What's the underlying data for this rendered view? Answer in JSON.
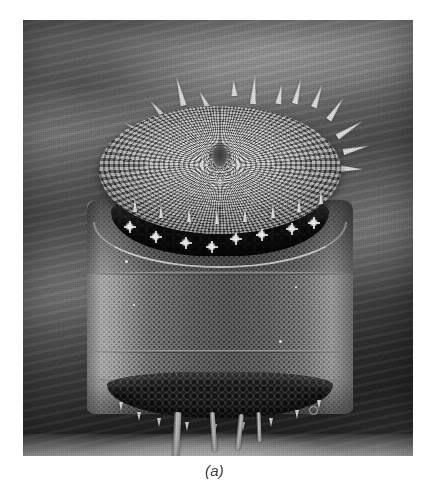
{
  "figure": {
    "caption": "(a)",
    "kind": "scanning-electron-micrograph",
    "palette": {
      "page_background": "#ffffff",
      "caption_color": "#3a3a3a",
      "photo_dark": "#242424",
      "photo_mid": "#6f6f6f",
      "photo_light": "#dcdcdc",
      "highlight": "#f2f2f2"
    },
    "photo": {
      "x": 23,
      "y": 20,
      "width": 390,
      "height": 436,
      "colorspace": "grayscale"
    },
    "features": {
      "valve_face_label": "top valve face with radial areolae",
      "front_pore_band_label": "coarse areolae band",
      "girdle_label": "girdle bands",
      "basal_band_label": "basal areolae band",
      "spines_label": "marginal spines",
      "legs_label": "basal setae"
    },
    "spines": [
      {
        "x": 96,
        "y": 4,
        "len": 30,
        "rot": -14
      },
      {
        "x": 120,
        "y": 18,
        "len": 20,
        "rot": -26
      },
      {
        "x": 74,
        "y": 26,
        "len": 24,
        "rot": -40
      },
      {
        "x": 52,
        "y": 44,
        "len": 26,
        "rot": -62
      },
      {
        "x": 34,
        "y": 62,
        "len": 22,
        "rot": -78
      },
      {
        "x": 28,
        "y": 84,
        "len": 18,
        "rot": -92
      },
      {
        "x": 150,
        "y": 8,
        "len": 16,
        "rot": -4
      },
      {
        "x": 170,
        "y": 2,
        "len": 30,
        "rot": 4
      },
      {
        "x": 196,
        "y": 12,
        "len": 20,
        "rot": 10
      },
      {
        "x": 214,
        "y": 6,
        "len": 26,
        "rot": 14
      },
      {
        "x": 234,
        "y": 12,
        "len": 24,
        "rot": 20
      },
      {
        "x": 252,
        "y": 24,
        "len": 26,
        "rot": 34
      },
      {
        "x": 266,
        "y": 42,
        "len": 30,
        "rot": 58
      },
      {
        "x": 272,
        "y": 64,
        "len": 26,
        "rot": 76
      },
      {
        "x": 268,
        "y": 86,
        "len": 22,
        "rot": 92
      }
    ],
    "rim_spines": [
      {
        "x": 52,
        "y": 126
      },
      {
        "x": 78,
        "y": 132
      },
      {
        "x": 106,
        "y": 136
      },
      {
        "x": 134,
        "y": 138
      },
      {
        "x": 162,
        "y": 136
      },
      {
        "x": 190,
        "y": 132
      },
      {
        "x": 216,
        "y": 126
      },
      {
        "x": 238,
        "y": 118
      }
    ],
    "stars": [
      {
        "x": 44,
        "y": 150
      },
      {
        "x": 70,
        "y": 160
      },
      {
        "x": 100,
        "y": 166
      },
      {
        "x": 126,
        "y": 170
      },
      {
        "x": 150,
        "y": 162
      },
      {
        "x": 176,
        "y": 158
      },
      {
        "x": 206,
        "y": 152
      },
      {
        "x": 228,
        "y": 146
      }
    ],
    "legs": [
      {
        "x": 92,
        "y": 340,
        "w": 7,
        "h": 54,
        "rot": 3
      },
      {
        "x": 130,
        "y": 340,
        "w": 5,
        "h": 40,
        "rot": -4
      },
      {
        "x": 156,
        "y": 342,
        "w": 5,
        "h": 36,
        "rot": 6
      },
      {
        "x": 176,
        "y": 340,
        "w": 4,
        "h": 30,
        "rot": -2
      }
    ],
    "basal_spines": [
      {
        "x": 38,
        "y": 330
      },
      {
        "x": 56,
        "y": 340
      },
      {
        "x": 76,
        "y": 346
      },
      {
        "x": 104,
        "y": 350
      },
      {
        "x": 132,
        "y": 352
      },
      {
        "x": 160,
        "y": 350
      },
      {
        "x": 188,
        "y": 346
      },
      {
        "x": 214,
        "y": 338
      },
      {
        "x": 236,
        "y": 328
      }
    ],
    "specks": [
      {
        "x": 44,
        "y": 188,
        "d": 3
      },
      {
        "x": 52,
        "y": 232,
        "d": 2
      },
      {
        "x": 198,
        "y": 268,
        "d": 3
      },
      {
        "x": 214,
        "y": 214,
        "d": 2
      }
    ],
    "ring_specks": [
      {
        "x": 286,
        "y": 386,
        "d": 7
      }
    ]
  }
}
